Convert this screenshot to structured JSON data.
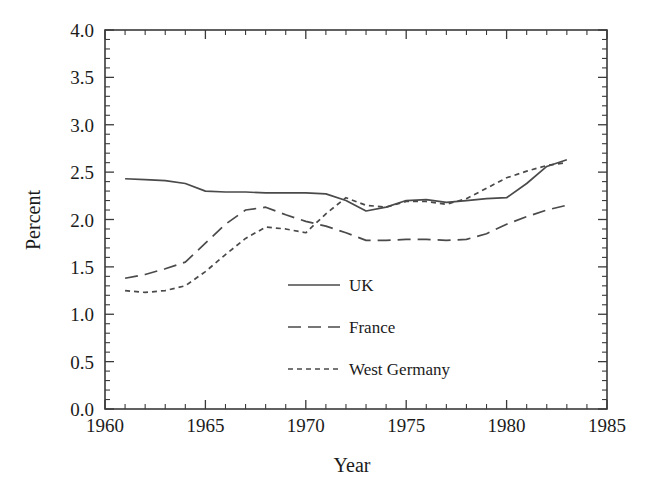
{
  "chart_data": {
    "type": "line",
    "title": "",
    "xlabel": "Year",
    "ylabel": "Percent",
    "xlim": [
      1960,
      1985
    ],
    "ylim": [
      0.0,
      4.0
    ],
    "xticks": [
      1960,
      1965,
      1970,
      1975,
      1980,
      1985
    ],
    "xtick_labels": [
      "1960",
      "1965",
      "1970",
      "1975",
      "1980",
      "1985"
    ],
    "yticks": [
      0.0,
      0.5,
      1.0,
      1.5,
      2.0,
      2.5,
      3.0,
      3.5,
      4.0
    ],
    "ytick_labels": [
      "0.0",
      "0.5",
      "1.0",
      "1.5",
      "2.0",
      "2.5",
      "3.0",
      "3.5",
      "4.0"
    ],
    "x_minor_tick_step": 1,
    "y_minor_tick_step": 0.1,
    "grid": false,
    "legend_position": "center",
    "x": [
      1961,
      1962,
      1963,
      1964,
      1965,
      1966,
      1967,
      1968,
      1969,
      1970,
      1971,
      1972,
      1973,
      1974,
      1975,
      1976,
      1977,
      1978,
      1979,
      1980,
      1981,
      1982,
      1983
    ],
    "series": [
      {
        "name": "UK",
        "line_style": "solid",
        "color": "#4a4a4a",
        "values": [
          2.43,
          2.42,
          2.41,
          2.38,
          2.3,
          2.29,
          2.29,
          2.28,
          2.28,
          2.28,
          2.27,
          2.2,
          2.09,
          2.13,
          2.2,
          2.21,
          2.18,
          2.2,
          2.22,
          2.23,
          2.38,
          2.56,
          2.63
        ]
      },
      {
        "name": "France",
        "line_style": "dashed",
        "color": "#4a4a4a",
        "values": [
          1.38,
          1.42,
          1.48,
          1.55,
          1.75,
          1.95,
          2.1,
          2.13,
          2.05,
          1.98,
          1.93,
          1.86,
          1.78,
          1.78,
          1.79,
          1.79,
          1.78,
          1.79,
          1.85,
          1.95,
          2.03,
          2.1,
          2.15
        ]
      },
      {
        "name": "West Germany",
        "line_style": "dotted",
        "color": "#4a4a4a",
        "values": [
          1.25,
          1.23,
          1.25,
          1.3,
          1.45,
          1.63,
          1.8,
          1.92,
          1.9,
          1.86,
          2.06,
          2.23,
          2.15,
          2.13,
          2.19,
          2.19,
          2.16,
          2.22,
          2.33,
          2.44,
          2.51,
          2.57,
          2.6
        ]
      }
    ]
  },
  "legend": {
    "items": [
      {
        "label": "UK",
        "style": "solid"
      },
      {
        "label": "France",
        "style": "dashed"
      },
      {
        "label": "West Germany",
        "style": "dotted"
      }
    ]
  }
}
